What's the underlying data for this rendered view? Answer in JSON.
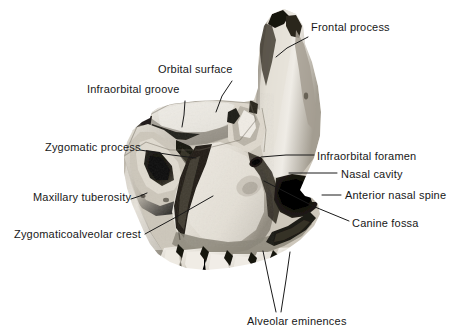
{
  "figure": {
    "background_color": "#ffffff",
    "text_color": "#181818",
    "leader_color": "#1a1a1a",
    "bone_light": "#e8e4dc",
    "bone_mid": "#b5 afa4",
    "bone_dark": "#4a4640",
    "bone_shadow": "#17150f"
  },
  "labels": [
    {
      "id": "frontal-process",
      "text": "Frontal process",
      "align": "left",
      "text_x": 311,
      "text_y": 28,
      "leader": [
        [
          308,
          37
        ],
        [
          287,
          48
        ],
        [
          276,
          57
        ]
      ]
    },
    {
      "id": "orbital-surface",
      "text": "Orbital surface",
      "align": "left",
      "text_x": 158,
      "text_y": 70,
      "leader": [
        [
          232,
          81
        ],
        [
          222,
          96
        ],
        [
          216,
          112
        ]
      ]
    },
    {
      "id": "infraorbital-groove",
      "text": "Infraorbital groove",
      "align": "left",
      "text_x": 87,
      "text_y": 90,
      "leader": [
        [
          185,
          101
        ],
        [
          184,
          115
        ],
        [
          182,
          127
        ]
      ]
    },
    {
      "id": "zygomatic-process",
      "text": "Zygomatic process",
      "align": "right",
      "text_x": 45,
      "text_y": 148,
      "leader": [
        [
          140,
          150
        ],
        [
          172,
          155
        ],
        [
          196,
          158
        ]
      ]
    },
    {
      "id": "maxillary-tuberosity",
      "text": "Maxillary tuberosity",
      "align": "right",
      "text_x": 33,
      "text_y": 198,
      "leader": [
        [
          131,
          199
        ],
        [
          140,
          196
        ],
        [
          147,
          193
        ]
      ]
    },
    {
      "id": "zygomaticoalveolar-crest",
      "text": "Zygomaticoalveolar crest",
      "align": "right",
      "text_x": 14,
      "text_y": 235,
      "leader": [
        [
          145,
          234
        ],
        [
          178,
          216
        ],
        [
          213,
          196
        ]
      ]
    },
    {
      "id": "infraorbital-foramen",
      "text": "Infraorbital foramen",
      "align": "left",
      "text_x": 317,
      "text_y": 157,
      "leader": [
        [
          314,
          155
        ],
        [
          286,
          155
        ],
        [
          261,
          157
        ]
      ]
    },
    {
      "id": "nasal-cavity",
      "text": "Nasal cavity",
      "align": "left",
      "text_x": 341,
      "text_y": 175,
      "leader": [
        [
          337,
          173
        ],
        [
          306,
          173
        ],
        [
          289,
          173
        ]
      ]
    },
    {
      "id": "anterior-nasal-spine",
      "text": "Anterior nasal spine",
      "align": "left",
      "text_x": 345,
      "text_y": 196,
      "leader": [
        [
          341,
          195
        ],
        [
          330,
          195
        ],
        [
          322,
          195
        ]
      ]
    },
    {
      "id": "canine-fossa",
      "text": "Canine fossa",
      "align": "left",
      "text_x": 352,
      "text_y": 224,
      "leader": [
        [
          349,
          221
        ],
        [
          315,
          207
        ],
        [
          264,
          181
        ]
      ]
    },
    {
      "id": "alveolar-eminences",
      "text": "Alveolar eminences",
      "align": "center",
      "text_x": 247,
      "text_y": 322,
      "leader": [
        [
          276,
          312
        ],
        [
          269,
          280
        ],
        [
          263,
          251
        ]
      ],
      "leader2": [
        [
          281,
          312
        ],
        [
          286,
          280
        ],
        [
          290,
          252
        ]
      ]
    }
  ]
}
